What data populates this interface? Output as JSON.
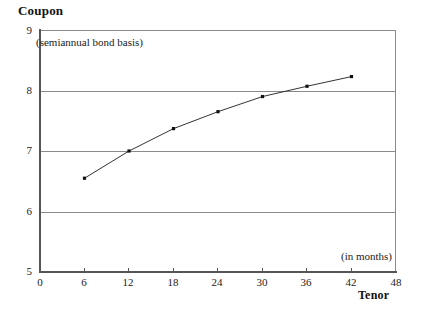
{
  "chart_data": {
    "type": "line",
    "title": "",
    "xlabel": "Tenor",
    "ylabel": "Coupon",
    "x": [
      6,
      12,
      18,
      24,
      30,
      36,
      42
    ],
    "values": [
      6.55,
      7.0,
      7.37,
      7.65,
      7.9,
      8.07,
      8.23
    ],
    "series": [
      {
        "name": "Coupon curve",
        "values": [
          6.55,
          7.0,
          7.37,
          7.65,
          7.9,
          8.07,
          8.23
        ]
      }
    ],
    "xlim": [
      0,
      48
    ],
    "ylim": [
      5,
      9
    ],
    "x_ticks": [
      0,
      6,
      12,
      18,
      24,
      30,
      36,
      42,
      48
    ],
    "y_ticks": [
      5,
      6,
      7,
      8,
      9
    ],
    "x_tick_labels": [
      "0",
      "6",
      "12",
      "18",
      "24",
      "30",
      "36",
      "42",
      "48"
    ],
    "y_tick_labels": [
      "5",
      "6",
      "7",
      "8",
      "9"
    ],
    "grid": true,
    "grid_axis": "y",
    "legend": "none",
    "annotations": [
      {
        "name": "units-note",
        "text": "(semiannual bond basis)"
      },
      {
        "name": "x-units-note",
        "text": "(in months)"
      }
    ],
    "line_color": "#333333",
    "marker_color": "#111111",
    "grid_color": "#8a8a8a",
    "axis_color": "#555555",
    "background_color": "#ffffff"
  },
  "axes": {
    "y_title": "Coupon",
    "x_title": "Tenor"
  },
  "notes": {
    "basis": "(semiannual bond basis)",
    "months": "(in months)"
  }
}
